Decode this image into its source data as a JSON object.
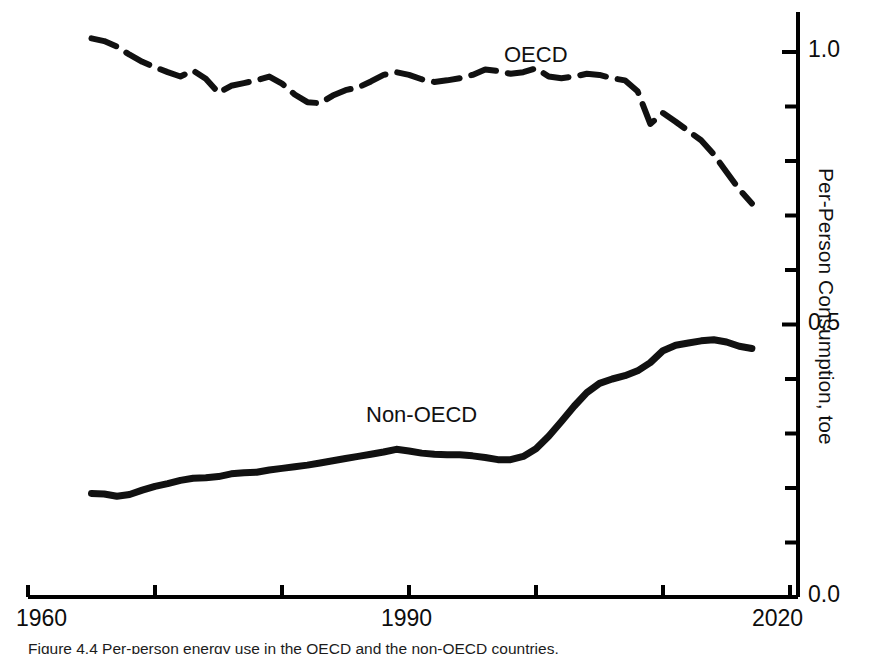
{
  "chart_data": {
    "type": "line",
    "title": "",
    "subtitle": "",
    "xlabel": "",
    "ylabel": "Per-Person Consumption, toe",
    "xlim": [
      1960,
      2020
    ],
    "ylim": [
      0.0,
      1.1
    ],
    "xticks": [
      1960,
      1970,
      1980,
      1990,
      2000,
      2010,
      2020
    ],
    "xtick_labels": [
      "1960",
      "",
      "",
      "1990",
      "",
      "",
      "2020"
    ],
    "yticks": [
      0.0,
      0.1,
      0.2,
      0.3,
      0.4,
      0.5,
      0.6,
      0.7,
      0.8,
      0.9,
      1.0
    ],
    "ytick_labels": [
      "0.0",
      "",
      "",
      "",
      "",
      "0.5",
      "",
      "",
      "",
      "",
      "1.0"
    ],
    "grid": false,
    "legend_position": "inline-annotations",
    "axis_color": "#000000",
    "series": [
      {
        "name": "OECD",
        "style": "dashed",
        "color": "#111111",
        "linewidth": 6,
        "label_x": 1997,
        "label_y": 1.04,
        "x": [
          1965,
          1966,
          1967,
          1968,
          1969,
          1970,
          1971,
          1972,
          1973,
          1974,
          1975,
          1976,
          1977,
          1978,
          1979,
          1980,
          1981,
          1982,
          1983,
          1984,
          1985,
          1986,
          1987,
          1988,
          1989,
          1990,
          1991,
          1992,
          1993,
          1994,
          1995,
          1996,
          1997,
          1998,
          1999,
          2000,
          2001,
          2002,
          2003,
          2004,
          2005,
          2006,
          2007,
          2008,
          2009,
          2010,
          2011,
          2012,
          2013,
          2014,
          2015,
          2016,
          2017
        ],
        "y": [
          1.025,
          1.02,
          1.01,
          0.995,
          0.982,
          0.972,
          0.963,
          0.955,
          0.966,
          0.951,
          0.925,
          0.938,
          0.943,
          0.948,
          0.955,
          0.942,
          0.922,
          0.908,
          0.906,
          0.92,
          0.93,
          0.935,
          0.946,
          0.958,
          0.963,
          0.958,
          0.95,
          0.945,
          0.948,
          0.952,
          0.958,
          0.968,
          0.965,
          0.96,
          0.963,
          0.97,
          0.955,
          0.952,
          0.955,
          0.96,
          0.958,
          0.952,
          0.948,
          0.928,
          0.868,
          0.888,
          0.872,
          0.855,
          0.838,
          0.812,
          0.78,
          0.748,
          0.722
        ]
      },
      {
        "name": "Non-OECD",
        "style": "solid",
        "color": "#111111",
        "linewidth": 7,
        "label_x": 1985,
        "label_y": 0.345,
        "x": [
          1965,
          1966,
          1967,
          1968,
          1969,
          1970,
          1971,
          1972,
          1973,
          1974,
          1975,
          1976,
          1977,
          1978,
          1979,
          1980,
          1981,
          1982,
          1983,
          1984,
          1985,
          1986,
          1987,
          1988,
          1989,
          1990,
          1991,
          1992,
          1993,
          1994,
          1995,
          1996,
          1997,
          1998,
          1999,
          2000,
          2001,
          2002,
          2003,
          2004,
          2005,
          2006,
          2007,
          2008,
          2009,
          2010,
          2011,
          2012,
          2013,
          2014,
          2015,
          2016,
          2017
        ],
        "y": [
          0.19,
          0.189,
          0.185,
          0.188,
          0.196,
          0.203,
          0.208,
          0.214,
          0.218,
          0.219,
          0.221,
          0.226,
          0.228,
          0.229,
          0.233,
          0.236,
          0.239,
          0.242,
          0.246,
          0.25,
          0.254,
          0.258,
          0.262,
          0.266,
          0.271,
          0.268,
          0.264,
          0.262,
          0.261,
          0.261,
          0.259,
          0.256,
          0.252,
          0.252,
          0.258,
          0.272,
          0.295,
          0.322,
          0.35,
          0.375,
          0.392,
          0.4,
          0.406,
          0.415,
          0.43,
          0.452,
          0.462,
          0.466,
          0.47,
          0.472,
          0.468,
          0.46,
          0.456
        ]
      }
    ]
  },
  "axis": {
    "y_title": "Per-Person Consumption, toe",
    "x_labels": [
      "1960",
      "1990",
      "2020"
    ],
    "y_labels": [
      "0.0",
      "0.5",
      "1.0"
    ]
  },
  "annotations": {
    "oecd": "OECD",
    "non_oecd": "Non-OECD"
  },
  "caption": "Figure 4.4  Per-person energy use in the OECD and the non-OECD countries."
}
